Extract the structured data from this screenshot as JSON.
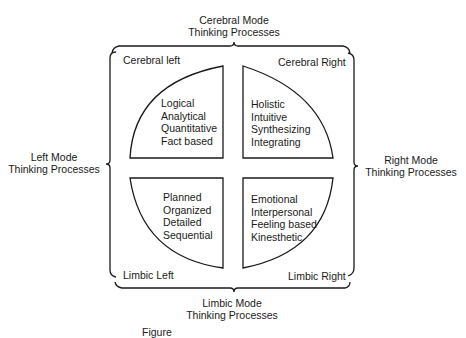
{
  "diagram": {
    "top_label": [
      "Cerebral Mode",
      "Thinking Processes"
    ],
    "bottom_label": [
      "Limbic Mode",
      "Thinking Processes"
    ],
    "left_label": [
      "Left Mode",
      "Thinking Processes"
    ],
    "right_label": [
      "Right Mode",
      "Thinking Processes"
    ],
    "quadrants": {
      "upper_left": {
        "name": "Cerebral left",
        "traits": [
          "Logical",
          "Analytical",
          "Quantitative",
          "Fact based"
        ]
      },
      "upper_right": {
        "name": "Cerebral Right",
        "traits": [
          "Holistic",
          "Intuitive",
          "Synthesizing",
          "Integrating"
        ]
      },
      "lower_left": {
        "name": "Limbic Left",
        "traits": [
          "Planned",
          "Organized",
          "Detailed",
          "Sequential"
        ]
      },
      "lower_right": {
        "name": "Limbic Right",
        "traits": [
          "Emotional",
          "Interpersonal",
          "Feeling based",
          "Kinesthetic"
        ]
      }
    },
    "caption": "Figure"
  },
  "colors": {
    "ink": "#1a1a1a",
    "background": "#ffffff"
  }
}
